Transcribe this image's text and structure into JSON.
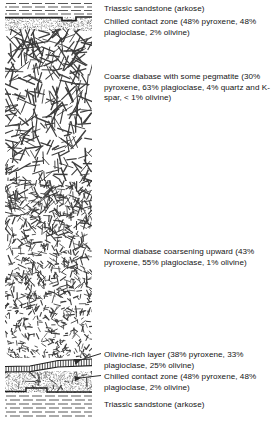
{
  "figure": {
    "kind": "stratigraphic-column-diagram",
    "title_visible": false,
    "ink_color": "#2b2b2b",
    "background": "#ffffff"
  },
  "column": {
    "x": 5,
    "y": 2,
    "width": 87,
    "height": 419,
    "units": [
      {
        "id": "top-sandstone",
        "name": "Triassic sandstone (arkose)",
        "pattern": "horizontal-dashes",
        "y_top": 2,
        "y_bottom": 16
      },
      {
        "id": "top-chilled-contact",
        "name": "Chilled contact zone",
        "pattern": "fine-stipple",
        "y_top": 16,
        "y_bottom": 30
      },
      {
        "id": "coarse-diabase-pegmatite",
        "name": "Coarse diabase with some pegmatite",
        "pattern": "large-laths",
        "y_top": 30,
        "y_bottom": 180
      },
      {
        "id": "normal-diabase",
        "name": "Normal diabase coarsening upward",
        "pattern": "small-laths",
        "y_top": 180,
        "y_bottom": 358
      },
      {
        "id": "olivine-rich-layer",
        "name": "Olivine-rich layer",
        "pattern": "ladder-hatch",
        "y_top": 358,
        "y_bottom": 372
      },
      {
        "id": "bottom-chilled-contact",
        "name": "Chilled contact zone",
        "pattern": "fine-stipple",
        "y_top": 372,
        "y_bottom": 392
      },
      {
        "id": "bottom-sandstone",
        "name": "Triassic sandstone (arkose)",
        "pattern": "horizontal-dashes",
        "y_top": 392,
        "y_bottom": 421
      }
    ]
  },
  "labels": [
    {
      "id": "label-top-sandstone",
      "text": "Triassic sandstone (arkose)"
    },
    {
      "id": "label-top-chilled",
      "text": "Chilled contact zone (48% pyroxene, 48% plagioclase, 2% olivine)"
    },
    {
      "id": "label-coarse-diabase",
      "text": "Coarse diabase with some pegmatite (30% pyroxene, 63% plagioclase, 4% quartz and K-spar, < 1% olivine)"
    },
    {
      "id": "label-normal-diabase",
      "text": "Normal diabase coarsening upward (43% pyroxene, 55% plagioclase, 1% olivine)"
    },
    {
      "id": "label-olivine-rich",
      "text": "Olivine-rich layer (38% pyroxene, 33% plagioclase, 25% olivine)"
    },
    {
      "id": "label-bottom-chilled",
      "text": "Chilled contact zone (48% pyroxene, 48% plagioclase, 2% olivine)"
    },
    {
      "id": "label-bottom-sandstone",
      "text": "Triassic sandstone (arkose)"
    }
  ],
  "leader_lines": [
    {
      "id": "leader-olivine-rich",
      "from": [
        104,
        356
      ],
      "to": [
        74,
        362
      ]
    },
    {
      "id": "leader-bottom-chilled",
      "from": [
        104,
        377
      ],
      "to": [
        74,
        379
      ]
    }
  ],
  "chart_data": {
    "type": "table",
    "columns": [
      "Unit",
      "Pyroxene %",
      "Plagioclase %",
      "Olivine %",
      "Quartz + K-spar %"
    ],
    "rows": [
      [
        "Triassic sandstone (arkose)",
        "",
        "",
        "",
        ""
      ],
      [
        "Chilled contact zone (upper)",
        "48",
        "48",
        "2",
        ""
      ],
      [
        "Coarse diabase with some pegmatite",
        "30",
        "63",
        "< 1",
        "4"
      ],
      [
        "Normal diabase coarsening upward",
        "43",
        "55",
        "1",
        ""
      ],
      [
        "Olivine-rich layer",
        "38",
        "33",
        "25",
        ""
      ],
      [
        "Chilled contact zone (lower)",
        "48",
        "48",
        "2",
        ""
      ],
      [
        "Triassic sandstone (arkose)",
        "",
        "",
        "",
        ""
      ]
    ]
  }
}
